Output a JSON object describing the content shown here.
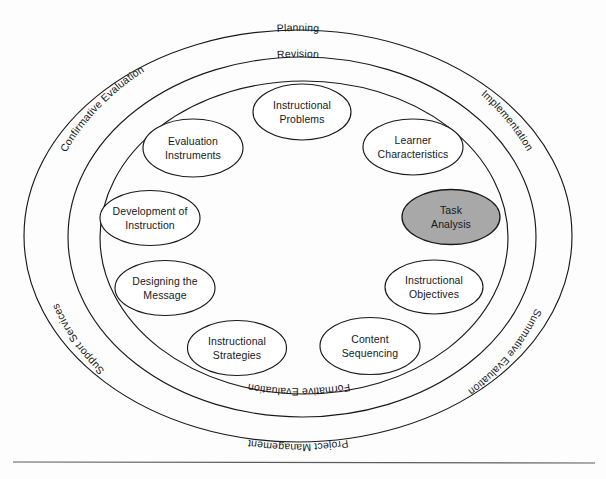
{
  "figure": {
    "kind": "concentric-ring-process-model",
    "background_color": "#fdfdfd",
    "line_color": "#1a1a1a",
    "highlight_fill": "#a8a8a8",
    "text_color": "#16181c"
  },
  "rings": {
    "outer": {
      "name": "outer-ring",
      "labels": [
        {
          "id": "planning",
          "text": "Planning",
          "position": "top-center"
        },
        {
          "id": "implementation",
          "text": "Implementation",
          "position": "upper-right"
        },
        {
          "id": "summative-evaluation",
          "text": "Summative Evaluation",
          "position": "lower-right"
        },
        {
          "id": "project-management",
          "text": "Project Management",
          "position": "bottom-center"
        },
        {
          "id": "support-services",
          "text": "Support Services",
          "position": "lower-left"
        },
        {
          "id": "confirmative-evaluation",
          "text": "Confirmative Evaluation",
          "position": "upper-left"
        }
      ]
    },
    "middle": {
      "name": "middle-ring",
      "labels": [
        {
          "id": "revision",
          "text": "Revision",
          "position": "top-center"
        },
        {
          "id": "formative-evaluation",
          "text": "Formative Evaluation",
          "position": "bottom-center"
        }
      ]
    },
    "inner": {
      "name": "inner-ring",
      "labels": []
    }
  },
  "core_elements": [
    {
      "id": "instructional-problems",
      "line1": "Instructional",
      "line2": "Problems",
      "highlighted": false
    },
    {
      "id": "learner-characteristics",
      "line1": "Learner",
      "line2": "Characteristics",
      "highlighted": false
    },
    {
      "id": "task-analysis",
      "line1": "Task",
      "line2": "Analysis",
      "highlighted": true
    },
    {
      "id": "instructional-objectives",
      "line1": "Instructional",
      "line2": "Objectives",
      "highlighted": false
    },
    {
      "id": "content-sequencing",
      "line1": "Content",
      "line2": "Sequencing",
      "highlighted": false
    },
    {
      "id": "instructional-strategies",
      "line1": "Instructional",
      "line2": "Strategies",
      "highlighted": false
    },
    {
      "id": "designing-the-message",
      "line1": "Designing the",
      "line2": "Message",
      "highlighted": false
    },
    {
      "id": "development-of-instruction",
      "line1": "Development of",
      "line2": "Instruction",
      "highlighted": false
    },
    {
      "id": "evaluation-instruments",
      "line1": "Evaluation",
      "line2": "Instruments",
      "highlighted": false
    }
  ]
}
